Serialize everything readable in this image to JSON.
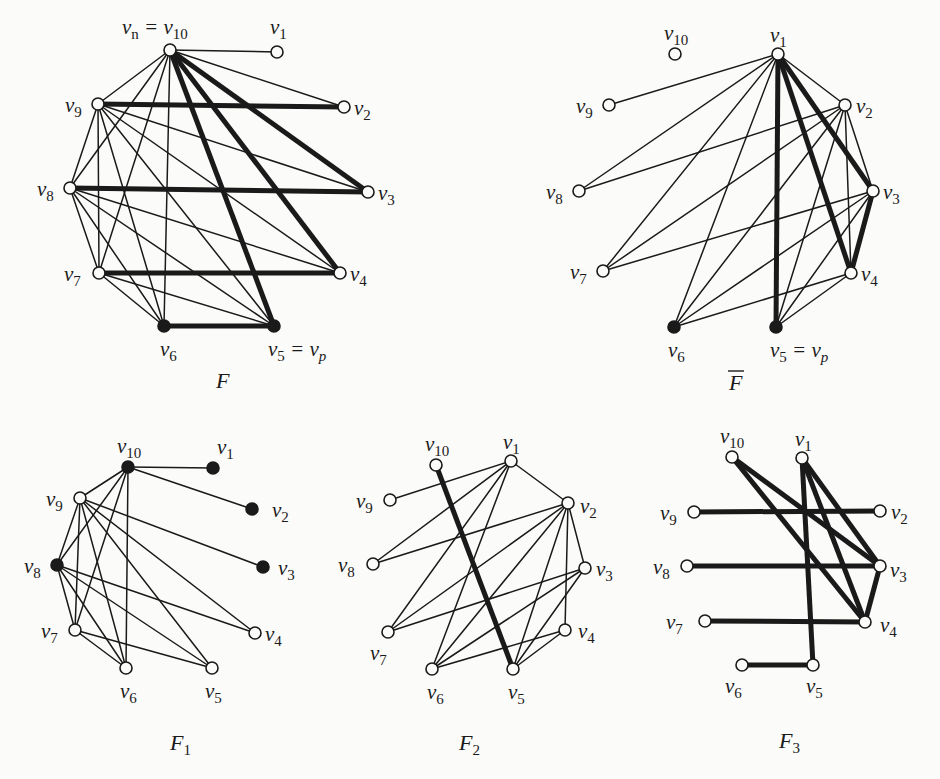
{
  "figure": {
    "graphs": [
      {
        "id": "F",
        "caption": "F",
        "caption_overline": false,
        "caption_sub": "",
        "caption_pos": [
          216,
          388
        ],
        "nodes": [
          {
            "id": "v10",
            "label": "v",
            "sub": "n",
            "extra": " = v",
            "extra_sub": "10",
            "x": 170,
            "y": 50,
            "filled": false,
            "lx": 122,
            "ly": 34
          },
          {
            "id": "v1",
            "label": "v",
            "sub": "1",
            "x": 277,
            "y": 52,
            "filled": false,
            "lx": 270,
            "ly": 34
          },
          {
            "id": "v9",
            "label": "v",
            "sub": "9",
            "x": 98,
            "y": 104,
            "filled": false,
            "lx": 65,
            "ly": 112
          },
          {
            "id": "v2",
            "label": "v",
            "sub": "2",
            "x": 344,
            "y": 107,
            "filled": false,
            "lx": 354,
            "ly": 115
          },
          {
            "id": "v8",
            "label": "v",
            "sub": "8",
            "x": 70,
            "y": 188,
            "filled": false,
            "lx": 37,
            "ly": 196
          },
          {
            "id": "v3",
            "label": "v",
            "sub": "3",
            "x": 368,
            "y": 192,
            "filled": false,
            "lx": 378,
            "ly": 200
          },
          {
            "id": "v7",
            "label": "v",
            "sub": "7",
            "x": 99,
            "y": 273,
            "filled": false,
            "lx": 64,
            "ly": 281
          },
          {
            "id": "v4",
            "label": "v",
            "sub": "4",
            "x": 340,
            "y": 273,
            "filled": false,
            "lx": 350,
            "ly": 281
          },
          {
            "id": "v6",
            "label": "v",
            "sub": "6",
            "x": 164,
            "y": 326,
            "filled": true,
            "lx": 160,
            "ly": 356
          },
          {
            "id": "v5",
            "label": "v",
            "sub": "5",
            "extra": " = v",
            "extra_sub": "p",
            "x": 274,
            "y": 326,
            "filled": true,
            "lx": 268,
            "ly": 356
          }
        ],
        "edges_thin": [
          [
            "v10",
            "v1"
          ],
          [
            "v10",
            "v2"
          ],
          [
            "v10",
            "v9"
          ],
          [
            "v10",
            "v8"
          ],
          [
            "v10",
            "v7"
          ],
          [
            "v10",
            "v6"
          ],
          [
            "v9",
            "v8"
          ],
          [
            "v9",
            "v7"
          ],
          [
            "v9",
            "v6"
          ],
          [
            "v9",
            "v5"
          ],
          [
            "v9",
            "v4"
          ],
          [
            "v9",
            "v3"
          ],
          [
            "v8",
            "v7"
          ],
          [
            "v8",
            "v6"
          ],
          [
            "v8",
            "v5"
          ],
          [
            "v8",
            "v4"
          ],
          [
            "v7",
            "v6"
          ],
          [
            "v7",
            "v5"
          ]
        ],
        "edges_thick": [
          [
            "v9",
            "v2"
          ],
          [
            "v8",
            "v3"
          ],
          [
            "v7",
            "v4"
          ],
          [
            "v6",
            "v5"
          ],
          [
            "v10",
            "v3"
          ],
          [
            "v10",
            "v4"
          ],
          [
            "v10",
            "v5"
          ]
        ]
      },
      {
        "id": "Fbar",
        "caption": "F",
        "caption_overline": true,
        "caption_sub": "",
        "caption_pos": [
          729,
          390
        ],
        "nodes": [
          {
            "id": "v10",
            "label": "v",
            "sub": "10",
            "x": 675,
            "y": 54,
            "filled": false,
            "lx": 664,
            "ly": 40
          },
          {
            "id": "v1",
            "label": "v",
            "sub": "1",
            "x": 778,
            "y": 54,
            "filled": false,
            "lx": 770,
            "ly": 42
          },
          {
            "id": "v9",
            "label": "v",
            "sub": "9",
            "x": 609,
            "y": 105,
            "filled": false,
            "lx": 576,
            "ly": 113
          },
          {
            "id": "v2",
            "label": "v",
            "sub": "2",
            "x": 845,
            "y": 105,
            "filled": false,
            "lx": 856,
            "ly": 113
          },
          {
            "id": "v8",
            "label": "v",
            "sub": "8",
            "x": 579,
            "y": 191,
            "filled": false,
            "lx": 546,
            "ly": 199
          },
          {
            "id": "v3",
            "label": "v",
            "sub": "3",
            "x": 873,
            "y": 191,
            "filled": false,
            "lx": 883,
            "ly": 199
          },
          {
            "id": "v7",
            "label": "v",
            "sub": "7",
            "x": 603,
            "y": 271,
            "filled": false,
            "lx": 570,
            "ly": 279
          },
          {
            "id": "v4",
            "label": "v",
            "sub": "4",
            "x": 851,
            "y": 273,
            "filled": false,
            "lx": 861,
            "ly": 281
          },
          {
            "id": "v6",
            "label": "v",
            "sub": "6",
            "x": 674,
            "y": 327,
            "filled": true,
            "lx": 668,
            "ly": 357
          },
          {
            "id": "v5",
            "label": "v",
            "sub": "5",
            "extra": " = v",
            "extra_sub": "p",
            "x": 776,
            "y": 327,
            "filled": true,
            "lx": 770,
            "ly": 357
          }
        ],
        "edges_thin": [
          [
            "v1",
            "v9"
          ],
          [
            "v1",
            "v8"
          ],
          [
            "v1",
            "v7"
          ],
          [
            "v1",
            "v6"
          ],
          [
            "v1",
            "v2"
          ],
          [
            "v2",
            "v8"
          ],
          [
            "v2",
            "v7"
          ],
          [
            "v2",
            "v6"
          ],
          [
            "v2",
            "v5"
          ],
          [
            "v2",
            "v4"
          ],
          [
            "v2",
            "v3"
          ],
          [
            "v3",
            "v7"
          ],
          [
            "v3",
            "v6"
          ],
          [
            "v3",
            "v5"
          ],
          [
            "v4",
            "v6"
          ],
          [
            "v4",
            "v5"
          ]
        ],
        "edges_thick": [
          [
            "v1",
            "v5"
          ],
          [
            "v1",
            "v4"
          ],
          [
            "v1",
            "v3"
          ],
          [
            "v3",
            "v4"
          ]
        ]
      },
      {
        "id": "F1",
        "caption": "F",
        "caption_overline": false,
        "caption_sub": "1",
        "caption_pos": [
          170,
          750
        ],
        "nodes": [
          {
            "id": "v10",
            "label": "v",
            "sub": "10",
            "x": 128,
            "y": 467,
            "filled": true,
            "lx": 117,
            "ly": 453
          },
          {
            "id": "v1",
            "label": "v",
            "sub": "1",
            "x": 213,
            "y": 468,
            "filled": true,
            "lx": 217,
            "ly": 454
          },
          {
            "id": "v9",
            "label": "v",
            "sub": "9",
            "x": 80,
            "y": 498,
            "filled": false,
            "lx": 46,
            "ly": 506
          },
          {
            "id": "v2",
            "label": "v",
            "sub": "2",
            "x": 252,
            "y": 509,
            "filled": true,
            "lx": 272,
            "ly": 517
          },
          {
            "id": "v8",
            "label": "v",
            "sub": "8",
            "x": 57,
            "y": 565,
            "filled": true,
            "lx": 24,
            "ly": 573
          },
          {
            "id": "v3",
            "label": "v",
            "sub": "3",
            "x": 263,
            "y": 567,
            "filled": true,
            "lx": 278,
            "ly": 575
          },
          {
            "id": "v7",
            "label": "v",
            "sub": "7",
            "x": 75,
            "y": 630,
            "filled": false,
            "lx": 41,
            "ly": 638
          },
          {
            "id": "v4",
            "label": "v",
            "sub": "4",
            "x": 255,
            "y": 633,
            "filled": false,
            "lx": 265,
            "ly": 641
          },
          {
            "id": "v6",
            "label": "v",
            "sub": "6",
            "x": 126,
            "y": 668,
            "filled": false,
            "lx": 120,
            "ly": 698
          },
          {
            "id": "v5",
            "label": "v",
            "sub": "5",
            "x": 212,
            "y": 668,
            "filled": false,
            "lx": 205,
            "ly": 698
          }
        ],
        "edges_thin": [
          [
            "v10",
            "v1"
          ],
          [
            "v10",
            "v2"
          ],
          [
            "v10",
            "v9"
          ],
          [
            "v10",
            "v8"
          ],
          [
            "v10",
            "v7"
          ],
          [
            "v10",
            "v6"
          ],
          [
            "v9",
            "v8"
          ],
          [
            "v9",
            "v7"
          ],
          [
            "v9",
            "v6"
          ],
          [
            "v9",
            "v5"
          ],
          [
            "v9",
            "v4"
          ],
          [
            "v9",
            "v3"
          ],
          [
            "v8",
            "v7"
          ],
          [
            "v8",
            "v6"
          ],
          [
            "v8",
            "v5"
          ],
          [
            "v8",
            "v4"
          ],
          [
            "v7",
            "v6"
          ],
          [
            "v7",
            "v5"
          ]
        ],
        "edges_thick": []
      },
      {
        "id": "F2",
        "caption": "F",
        "caption_overline": false,
        "caption_sub": "2",
        "caption_pos": [
          459,
          750
        ],
        "nodes": [
          {
            "id": "v10",
            "label": "v",
            "sub": "10",
            "x": 436,
            "y": 465,
            "filled": false,
            "lx": 425,
            "ly": 451
          },
          {
            "id": "v1",
            "label": "v",
            "sub": "1",
            "x": 511,
            "y": 461,
            "filled": false,
            "lx": 503,
            "ly": 449
          },
          {
            "id": "v9",
            "label": "v",
            "sub": "9",
            "x": 390,
            "y": 500,
            "filled": false,
            "lx": 356,
            "ly": 508
          },
          {
            "id": "v2",
            "label": "v",
            "sub": "2",
            "x": 568,
            "y": 503,
            "filled": false,
            "lx": 580,
            "ly": 513
          },
          {
            "id": "v8",
            "label": "v",
            "sub": "8",
            "x": 373,
            "y": 564,
            "filled": false,
            "lx": 338,
            "ly": 572
          },
          {
            "id": "v3",
            "label": "v",
            "sub": "3",
            "x": 585,
            "y": 568,
            "filled": false,
            "lx": 596,
            "ly": 576
          },
          {
            "id": "v7",
            "label": "v",
            "sub": "7",
            "x": 388,
            "y": 632,
            "filled": false,
            "lx": 370,
            "ly": 660
          },
          {
            "id": "v4",
            "label": "v",
            "sub": "4",
            "x": 565,
            "y": 630,
            "filled": false,
            "lx": 578,
            "ly": 638
          },
          {
            "id": "v6",
            "label": "v",
            "sub": "6",
            "x": 432,
            "y": 669,
            "filled": false,
            "lx": 427,
            "ly": 699
          },
          {
            "id": "v5",
            "label": "v",
            "sub": "5",
            "x": 513,
            "y": 669,
            "filled": false,
            "lx": 508,
            "ly": 699
          }
        ],
        "edges_thin": [
          [
            "v1",
            "v9"
          ],
          [
            "v1",
            "v8"
          ],
          [
            "v1",
            "v7"
          ],
          [
            "v1",
            "v6"
          ],
          [
            "v1",
            "v2"
          ],
          [
            "v2",
            "v8"
          ],
          [
            "v2",
            "v7"
          ],
          [
            "v2",
            "v6"
          ],
          [
            "v2",
            "v5"
          ],
          [
            "v2",
            "v4"
          ],
          [
            "v2",
            "v3"
          ],
          [
            "v3",
            "v7"
          ],
          [
            "v3",
            "v6"
          ],
          [
            "v3",
            "v5"
          ],
          [
            "v4",
            "v6"
          ],
          [
            "v4",
            "v5"
          ]
        ],
        "edges_thick": [
          [
            "v10",
            "v5"
          ]
        ]
      },
      {
        "id": "F3",
        "caption": "F",
        "caption_overline": false,
        "caption_sub": "3",
        "caption_pos": [
          779,
          748
        ],
        "nodes": [
          {
            "id": "v10",
            "label": "v",
            "sub": "10",
            "x": 732,
            "y": 457,
            "filled": false,
            "lx": 720,
            "ly": 443
          },
          {
            "id": "v1",
            "label": "v",
            "sub": "1",
            "x": 802,
            "y": 458,
            "filled": false,
            "lx": 795,
            "ly": 446
          },
          {
            "id": "v9",
            "label": "v",
            "sub": "9",
            "x": 694,
            "y": 512,
            "filled": false,
            "lx": 660,
            "ly": 520
          },
          {
            "id": "v2",
            "label": "v",
            "sub": "2",
            "x": 880,
            "y": 511,
            "filled": false,
            "lx": 891,
            "ly": 519
          },
          {
            "id": "v8",
            "label": "v",
            "sub": "8",
            "x": 687,
            "y": 566,
            "filled": false,
            "lx": 653,
            "ly": 574
          },
          {
            "id": "v3",
            "label": "v",
            "sub": "3",
            "x": 880,
            "y": 566,
            "filled": false,
            "lx": 890,
            "ly": 577
          },
          {
            "id": "v7",
            "label": "v",
            "sub": "7",
            "x": 705,
            "y": 621,
            "filled": false,
            "lx": 666,
            "ly": 629
          },
          {
            "id": "v4",
            "label": "v",
            "sub": "4",
            "x": 865,
            "y": 622,
            "filled": false,
            "lx": 880,
            "ly": 632
          },
          {
            "id": "v6",
            "label": "v",
            "sub": "6",
            "x": 742,
            "y": 665,
            "filled": false,
            "lx": 725,
            "ly": 693
          },
          {
            "id": "v5",
            "label": "v",
            "sub": "5",
            "x": 813,
            "y": 665,
            "filled": false,
            "lx": 806,
            "ly": 693
          }
        ],
        "edges_thin": [],
        "edges_thick": [
          [
            "v9",
            "v2"
          ],
          [
            "v8",
            "v3"
          ],
          [
            "v7",
            "v4"
          ],
          [
            "v6",
            "v5"
          ],
          [
            "v10",
            "v3"
          ],
          [
            "v10",
            "v4"
          ],
          [
            "v1",
            "v5"
          ],
          [
            "v1",
            "v3"
          ],
          [
            "v1",
            "v4"
          ],
          [
            "v3",
            "v4"
          ]
        ]
      }
    ]
  }
}
